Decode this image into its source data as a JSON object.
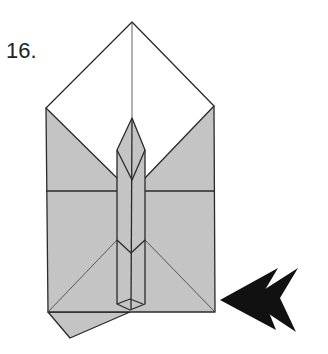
{
  "diagram": {
    "step_label": "16.",
    "colors": {
      "paper_gray": "#c4c4c4",
      "paper_white": "#ffffff",
      "line": "#2a2a2a",
      "arrow": "#111111"
    },
    "elements": [
      "white-top-triangle-flap",
      "gray-body",
      "central-column-point",
      "horizontal-crease",
      "bottom-left-flap",
      "double-push-arrow"
    ]
  }
}
